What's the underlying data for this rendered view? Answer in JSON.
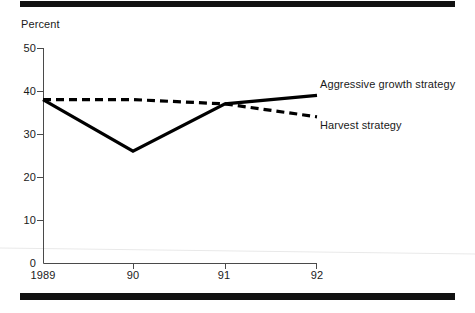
{
  "figure": {
    "axis_title": "Percent",
    "rules": {
      "top": "top-rule",
      "bottom": "bottom-rule"
    }
  },
  "chart_data": {
    "type": "line",
    "title": "",
    "subtitle": "",
    "xlabel": "",
    "ylabel": "Percent",
    "x": [
      "1989",
      "90",
      "91",
      "92"
    ],
    "categories": [
      "1989",
      "90",
      "91",
      "92"
    ],
    "xtick_labels": [
      "1989",
      "90",
      "91",
      "92"
    ],
    "ytick_labels": [
      "0",
      "10",
      "20",
      "30",
      "40",
      "50"
    ],
    "yticks": [
      0,
      10,
      20,
      30,
      40,
      50
    ],
    "ylim": [
      0,
      50
    ],
    "xlim": [
      "1989",
      "92"
    ],
    "grid": false,
    "legend_position": "inline-right-of-line-ends",
    "series": [
      {
        "name": "Aggressive growth strategy",
        "style": "solid",
        "color": "#000000",
        "values": [
          38,
          26,
          37,
          39
        ]
      },
      {
        "name": "Harvest strategy",
        "style": "dashed",
        "color": "#000000",
        "values": [
          38,
          38,
          37,
          34
        ]
      }
    ],
    "annotations": [
      {
        "text": "Aggressive growth strategy",
        "attached_to": "Aggressive growth strategy"
      },
      {
        "text": "Harvest strategy",
        "attached_to": "Harvest strategy"
      }
    ]
  }
}
